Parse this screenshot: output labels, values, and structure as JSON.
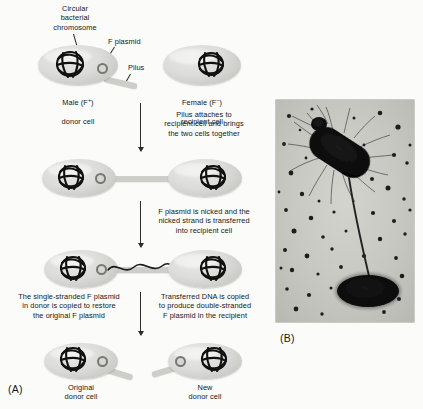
{
  "figure": {
    "panel_a_letter": "(A)",
    "panel_b_letter": "(B)"
  },
  "labels": {
    "chromosome": "Circular\nbacterial\nchromosome",
    "f_plasmid": "F plasmid",
    "pilus": "Pilus",
    "male_line1": "Male (F",
    "male_sup": "+",
    "male_line1_end": ")",
    "male_line2": "donor cell",
    "female_line1": "Female (F",
    "female_sup": "–",
    "female_line1_end": ")",
    "female_line2": "recipient cell",
    "original_donor": "Original\ndonor cell",
    "new_donor": "New\ndonor cell"
  },
  "steps": [
    {
      "id": "step-1-caption",
      "text": "Pilus attaches to\nrecipient cell and brings\nthe two cells together"
    },
    {
      "id": "step-2-caption",
      "text": "F plasmid is nicked and the\nnicked strand is transferred\ninto recipient cell"
    },
    {
      "id": "step-3-caption-left",
      "text": "The single-stranded F plasmid\nin donor is copied to restore\nthe original F plasmid"
    },
    {
      "id": "step-3-caption-right",
      "text": "Transferred DNA is copied\nto produce double-stranded\nF plasmid in the recipient"
    }
  ],
  "colors": {
    "background": "#fbfbf9",
    "cell_fill": "#dcdcda",
    "cell_edge": "#bdbdba",
    "plasmid_stroke": "#777774",
    "chromosome_stroke": "#111111",
    "text": "#161616",
    "photo_background": "#c9c9c4",
    "photo_cell": "#121212"
  },
  "micrograph": {
    "description": "electron micrograph of two conjugating bacteria joined by a pilus",
    "upper_cell": "rod-shaped donor bacterium with many surface pili",
    "lower_cell": "oval recipient bacterium",
    "connector": "long conjugative pilus bridging the two cells",
    "particles": "scattered dark spherical phage particles on the background"
  }
}
